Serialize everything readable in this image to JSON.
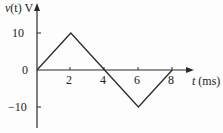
{
  "chart_data": {
    "type": "line",
    "title": "",
    "xlabel": "t (ms)",
    "ylabel": "v(t) V",
    "x": [
      0,
      2,
      4,
      6,
      8
    ],
    "series": [
      {
        "name": "v(t)",
        "values": [
          0,
          10,
          0,
          -10,
          0
        ]
      }
    ],
    "xticks": [
      2,
      4,
      6,
      8
    ],
    "yticks": [
      10,
      0,
      -10
    ],
    "xlim": [
      0,
      9
    ],
    "ylim": [
      -12,
      13
    ],
    "grid": false,
    "legend": null
  },
  "labels": {
    "ylabel_var": "v",
    "ylabel_arg": "(t)",
    "ylabel_unit": "V",
    "xlabel_var": "t",
    "xlabel_unit": "(ms)",
    "ytick_pos": "10",
    "ytick_zero": "0",
    "ytick_neg": "−10",
    "xtick_2": "2",
    "xtick_4": "4",
    "xtick_6": "6",
    "xtick_8": "8"
  },
  "colors": {
    "line": "#2a2a2a",
    "axis": "#2a2a2a",
    "background": "#fdfdfd"
  }
}
